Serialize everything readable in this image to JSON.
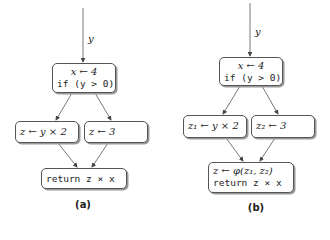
{
  "diagram_a": {
    "caption": "(a)",
    "input_label": "y",
    "entry": {
      "line1": "x ← 4",
      "line2": "if (y > 0)"
    },
    "left": {
      "text": "z ← y × 2"
    },
    "right": {
      "text": "z ← 3"
    },
    "exit": {
      "text": "return z × x"
    }
  },
  "diagram_b": {
    "caption": "(b)",
    "input_label": "y",
    "entry": {
      "line1": "x ← 4",
      "line2": "if (y > 0)"
    },
    "left": {
      "text": "z₁ ← y × 2"
    },
    "right": {
      "text": "z₂ ← 3"
    },
    "exit": {
      "line1": "z ← φ(z₁, z₂)",
      "line2": "return z × x"
    }
  },
  "colors": {
    "stroke": "#555555",
    "shadow": "#9a9a9a",
    "background": "#ffffff"
  }
}
